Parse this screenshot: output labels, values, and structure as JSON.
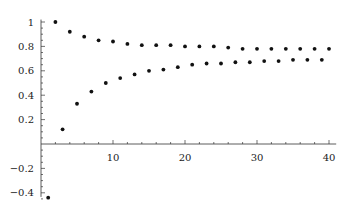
{
  "chart_data": {
    "type": "scatter",
    "title": "",
    "xlabel": "",
    "ylabel": "",
    "xlim": [
      0,
      41
    ],
    "ylim": [
      -0.45,
      1.02
    ],
    "grid": false,
    "legend": null,
    "x_ticks": [
      10,
      20,
      30,
      40
    ],
    "x_tick_labels": [
      "10",
      "20",
      "30",
      "40"
    ],
    "y_ticks": [
      -0.4,
      -0.2,
      0.2,
      0.4,
      0.6,
      0.8,
      1
    ],
    "y_tick_labels": [
      "-0.4",
      "-0.2",
      "0.2",
      "0.4",
      "0.6",
      "0.8",
      "1"
    ],
    "series": [
      {
        "name": "even n",
        "x": [
          2,
          4,
          6,
          8,
          10,
          12,
          14,
          16,
          18,
          20,
          22,
          24,
          26,
          28,
          30,
          32,
          34,
          36,
          38,
          40
        ],
        "y": [
          1.0,
          0.92,
          0.88,
          0.85,
          0.84,
          0.82,
          0.81,
          0.81,
          0.81,
          0.8,
          0.8,
          0.8,
          0.79,
          0.78,
          0.78,
          0.78,
          0.78,
          0.78,
          0.78,
          0.78
        ]
      },
      {
        "name": "odd n",
        "x": [
          1,
          3,
          5,
          7,
          9,
          11,
          13,
          15,
          17,
          19,
          21,
          23,
          25,
          27,
          29,
          31,
          33,
          35,
          37,
          39
        ],
        "y": [
          -0.44,
          0.12,
          0.33,
          0.43,
          0.5,
          0.54,
          0.57,
          0.6,
          0.61,
          0.63,
          0.65,
          0.66,
          0.66,
          0.67,
          0.67,
          0.68,
          0.68,
          0.69,
          0.69,
          0.69
        ]
      }
    ]
  },
  "style": {
    "point_color": "#111111",
    "axis_color": "#333333"
  }
}
